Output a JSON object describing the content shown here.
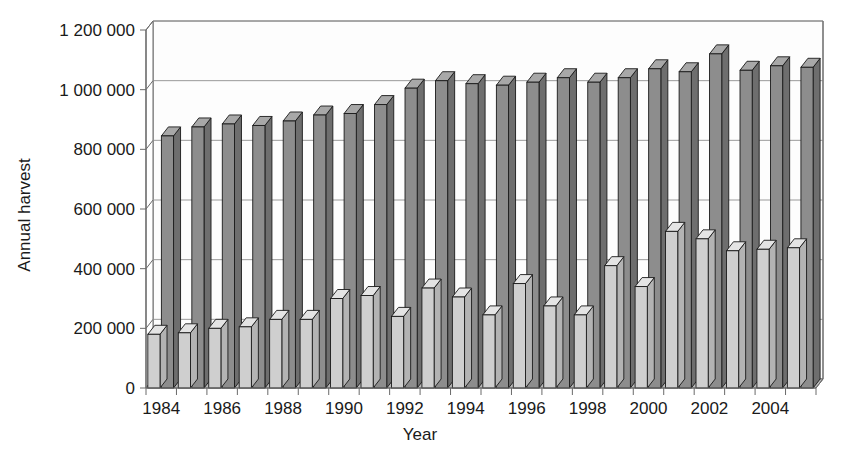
{
  "chart_data": {
    "type": "bar",
    "title": "",
    "subtitle": "",
    "xlabel": "Year",
    "ylabel": "Annual harvest",
    "ylim": [
      0,
      1200000
    ],
    "xlim_categories": [
      "1984",
      "1985",
      "1986",
      "1987",
      "1988",
      "1989",
      "1990",
      "1991",
      "1992",
      "1993",
      "1994",
      "1995",
      "1996",
      "1997",
      "1998",
      "1999",
      "2000",
      "2001",
      "2002",
      "2003",
      "2004",
      "2005"
    ],
    "categories": [
      "1984",
      "1985",
      "1986",
      "1987",
      "1988",
      "1989",
      "1990",
      "1991",
      "1992",
      "1993",
      "1994",
      "1995",
      "1996",
      "1997",
      "1998",
      "1999",
      "2000",
      "2001",
      "2002",
      "2003",
      "2004",
      "2005"
    ],
    "y_tick_labels": [
      "0",
      "200 000",
      "400 000",
      "600 000",
      "800 000",
      "1 000 000",
      "1 200 000"
    ],
    "y_ticks": [
      0,
      200000,
      400000,
      600000,
      800000,
      1000000,
      1200000
    ],
    "x_tick_labels": [
      "1984",
      "1986",
      "1988",
      "1990",
      "1992",
      "1994",
      "1996",
      "1998",
      "2000",
      "2002",
      "2004"
    ],
    "x_tick_label_years": [
      1984,
      1986,
      1988,
      1990,
      1992,
      1994,
      1996,
      1998,
      2000,
      2002,
      2004
    ],
    "grid": true,
    "grid_axis": "y",
    "legend": false,
    "legend_position": "none",
    "three_d": true,
    "series": [
      {
        "name": "light-series",
        "color": "#c9c9c9",
        "values": [
          180000,
          185000,
          200000,
          205000,
          230000,
          230000,
          300000,
          310000,
          240000,
          335000,
          305000,
          245000,
          350000,
          275000,
          245000,
          410000,
          340000,
          525000,
          500000,
          460000,
          465000,
          470000
        ]
      },
      {
        "name": "dark-series",
        "color": "#8a8a8a",
        "values": [
          845000,
          875000,
          885000,
          880000,
          895000,
          915000,
          920000,
          950000,
          1005000,
          1030000,
          1020000,
          1015000,
          1025000,
          1040000,
          1025000,
          1040000,
          1070000,
          1060000,
          1120000,
          1065000,
          1080000,
          1075000
        ]
      }
    ]
  },
  "colors": {
    "light_bar_face": "#cfcfcf",
    "light_bar_top": "#e4e4e4",
    "light_bar_side": "#b3b3b3",
    "dark_bar_face": "#8d8d8d",
    "dark_bar_top": "#a8a8a8",
    "dark_bar_side": "#6e6e6e",
    "outline": "#1a1a1a",
    "grid": "#9a9a9a",
    "axis": "#6a6a6a",
    "floor": "#b9b9b9",
    "background": "#ffffff"
  },
  "labels": {
    "ylabel": "Annual harvest",
    "xlabel": "Year"
  }
}
